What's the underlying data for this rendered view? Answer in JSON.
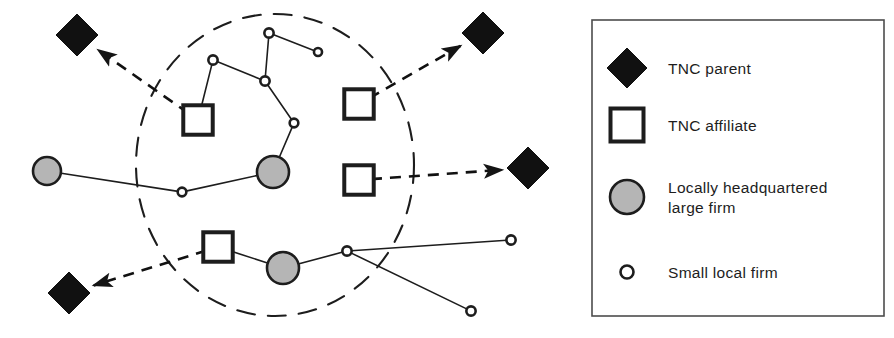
{
  "figure": {
    "type": "network-diagram",
    "canvas": {
      "width": 894,
      "height": 338,
      "background": "#ffffff"
    }
  },
  "colors": {
    "ink": "#1a1a1a",
    "stroke": "#1d1d1d",
    "fill_solid": "#111111",
    "fill_gray": "#b5b5b5",
    "fill_white": "#ffffff",
    "legend_border": "#4d4d4d"
  },
  "region_boundary": {
    "name": "city-region-boundary",
    "shape": "dashed-ellipse",
    "cx": 275,
    "cy": 165,
    "rx": 139,
    "ry": 151,
    "dash": "18 13",
    "stroke_width": 2.1
  },
  "nodes": [
    {
      "id": "p1",
      "kind": "tnc-parent",
      "x": 77,
      "y": 35,
      "size": 21,
      "inside_region": false
    },
    {
      "id": "p2",
      "kind": "tnc-parent",
      "x": 483,
      "y": 33,
      "size": 21,
      "inside_region": false
    },
    {
      "id": "p3",
      "kind": "tnc-parent",
      "x": 528,
      "y": 168,
      "size": 21,
      "inside_region": false
    },
    {
      "id": "p4",
      "kind": "tnc-parent",
      "x": 69,
      "y": 293,
      "size": 21,
      "inside_region": false
    },
    {
      "id": "a1",
      "kind": "tnc-affiliate",
      "x": 198,
      "y": 120,
      "size": 19,
      "inside_region": true
    },
    {
      "id": "a2",
      "kind": "tnc-affiliate",
      "x": 359,
      "y": 104,
      "size": 19,
      "inside_region": true
    },
    {
      "id": "a3",
      "kind": "tnc-affiliate",
      "x": 359,
      "y": 180,
      "size": 19,
      "inside_region": true
    },
    {
      "id": "a4",
      "kind": "tnc-affiliate",
      "x": 218,
      "y": 247,
      "size": 19,
      "inside_region": true
    },
    {
      "id": "g1",
      "kind": "local-large",
      "x": 47,
      "y": 171,
      "size": 14,
      "inside_region": false
    },
    {
      "id": "g2",
      "kind": "local-large",
      "x": 273,
      "y": 172,
      "size": 16,
      "inside_region": true
    },
    {
      "id": "g3",
      "kind": "local-large",
      "x": 283,
      "y": 268,
      "size": 16,
      "inside_region": true
    },
    {
      "id": "s1",
      "kind": "local-small",
      "x": 269,
      "y": 33,
      "size": 7.5,
      "inside_region": true
    },
    {
      "id": "s2",
      "kind": "local-small",
      "x": 318,
      "y": 52,
      "size": 6.5,
      "inside_region": true
    },
    {
      "id": "s3",
      "kind": "local-small",
      "x": 213,
      "y": 60,
      "size": 7.5,
      "inside_region": true
    },
    {
      "id": "s4",
      "kind": "local-small",
      "x": 265,
      "y": 81,
      "size": 7.5,
      "inside_region": true
    },
    {
      "id": "s5",
      "kind": "local-small",
      "x": 294,
      "y": 123,
      "size": 7.0,
      "inside_region": true
    },
    {
      "id": "s6",
      "kind": "local-small",
      "x": 182,
      "y": 192,
      "size": 7.0,
      "inside_region": true
    },
    {
      "id": "s7",
      "kind": "local-small",
      "x": 347,
      "y": 251,
      "size": 7.5,
      "inside_region": true
    },
    {
      "id": "s8",
      "kind": "local-small",
      "x": 511,
      "y": 240,
      "size": 7.5,
      "inside_region": false
    },
    {
      "id": "s9",
      "kind": "local-small",
      "x": 471,
      "y": 311,
      "size": 7.5,
      "inside_region": false
    }
  ],
  "solid_links": [
    {
      "from": "s3",
      "to": "a1"
    },
    {
      "from": "s3",
      "to": "s4"
    },
    {
      "from": "s1",
      "to": "s4"
    },
    {
      "from": "s1",
      "to": "s2"
    },
    {
      "from": "s4",
      "to": "s5"
    },
    {
      "from": "s5",
      "to": "g2"
    },
    {
      "from": "g2",
      "to": "s6"
    },
    {
      "from": "s6",
      "to": "g1"
    },
    {
      "from": "a4",
      "to": "g3"
    },
    {
      "from": "g3",
      "to": "s7"
    },
    {
      "from": "s7",
      "to": "s8"
    },
    {
      "from": "s7",
      "to": "s9"
    }
  ],
  "dashed_links": [
    {
      "from": "a1",
      "to": "p1",
      "arrow": "end",
      "label": "affiliate-to-parent-link"
    },
    {
      "from": "a2",
      "to": "p2",
      "arrow": "end",
      "label": "affiliate-to-parent-link"
    },
    {
      "from": "a3",
      "to": "p3",
      "arrow": "end",
      "label": "affiliate-to-parent-link"
    },
    {
      "from": "a4",
      "to": "p4",
      "arrow": "end",
      "label": "affiliate-to-parent-link"
    }
  ],
  "legend": {
    "name": "legend-box",
    "box": {
      "x": 592,
      "y": 20,
      "width": 292,
      "height": 296
    },
    "items": [
      {
        "symbol": "diamond-filled-icon",
        "label": "TNC parent",
        "sym_x": 627,
        "sym_y": 68,
        "text_x": 668,
        "text_y": 74
      },
      {
        "symbol": "square-outline-icon",
        "label": "TNC affiliate",
        "sym_x": 627,
        "sym_y": 125,
        "text_x": 668,
        "text_y": 131
      },
      {
        "symbol": "circle-gray-icon",
        "label": "Locally headquartered",
        "label2": "large firm",
        "sym_x": 627,
        "sym_y": 197,
        "text_x": 668,
        "text_y": 193
      },
      {
        "symbol": "circle-small-icon",
        "label": "Small local firm",
        "sym_x": 627,
        "sym_y": 272,
        "text_x": 668,
        "text_y": 278
      }
    ]
  }
}
